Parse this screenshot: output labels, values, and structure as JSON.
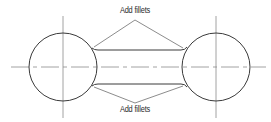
{
  "diagram": {
    "title": "",
    "annotations": {
      "top": "Add fillets",
      "bottom": "Add fillets"
    },
    "colors": {
      "line": "#3a3a3a",
      "centerline": "#8a8a8a",
      "background": "#ffffff"
    },
    "elements": [
      {
        "type": "circle",
        "name": "left-circle"
      },
      {
        "type": "circle",
        "name": "right-circle"
      },
      {
        "type": "line",
        "name": "top-tangent-edge"
      },
      {
        "type": "line",
        "name": "bottom-tangent-edge"
      },
      {
        "type": "centerline",
        "name": "horizontal-centerline"
      },
      {
        "type": "centerline",
        "name": "left-vertical-centerline"
      },
      {
        "type": "centerline",
        "name": "right-vertical-centerline"
      },
      {
        "type": "leader",
        "name": "top-leader-lines"
      },
      {
        "type": "leader",
        "name": "bottom-leader-lines"
      }
    ]
  }
}
